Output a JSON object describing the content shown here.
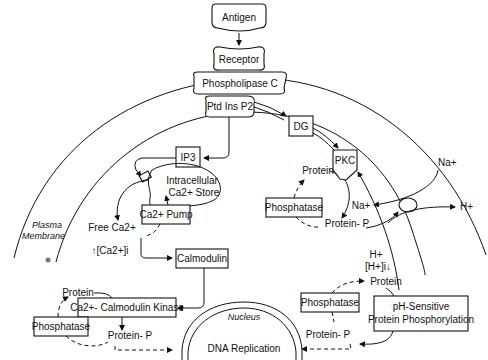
{
  "diagram": {
    "nodes": {
      "antigen": "Antigen",
      "receptor": "Receptor",
      "phospholipase_c": "Phospholipase C",
      "ptd_ins_p2": "Ptd Ins P2",
      "ip3": "IP3",
      "dg": "DG",
      "pkc": "PKC",
      "intracellular_store_line1": "Intracellular",
      "intracellular_store_line2": "Ca2+ Store",
      "ca_pump": "Ca2+ Pump",
      "free_ca": "Free Ca2+",
      "ca_increase": "↑[Ca2+]i",
      "calmodulin": "Calmodulin",
      "ca_calmodulin_kinase": "Ca2+- Calmodulin Kinase",
      "protein_left": "Protein",
      "protein_p_left": "Protein- P",
      "phosphatase_left": "Phosphatase",
      "protein_pkc": "Protein",
      "protein_p_pkc": "Protein- P",
      "phosphatase_pkc": "Phosphatase",
      "na_out": "Na+",
      "na_in": "Na+",
      "h_out": "H+",
      "h_in": "H+",
      "h_decrease": "[H+]i↓",
      "protein_right": "Protein",
      "protein_p_right": "Protein- P",
      "phosphatase_right": "Phosphatase",
      "ph_sensitive_line1": "pH-Sensitive",
      "ph_sensitive_line2": "Protein Phosphorylation",
      "nucleus": "Nucleus",
      "dna_replication": "DNA Replication",
      "plasma_membrane_line1": "Plasma",
      "plasma_membrane_line2": "Membrane"
    }
  }
}
